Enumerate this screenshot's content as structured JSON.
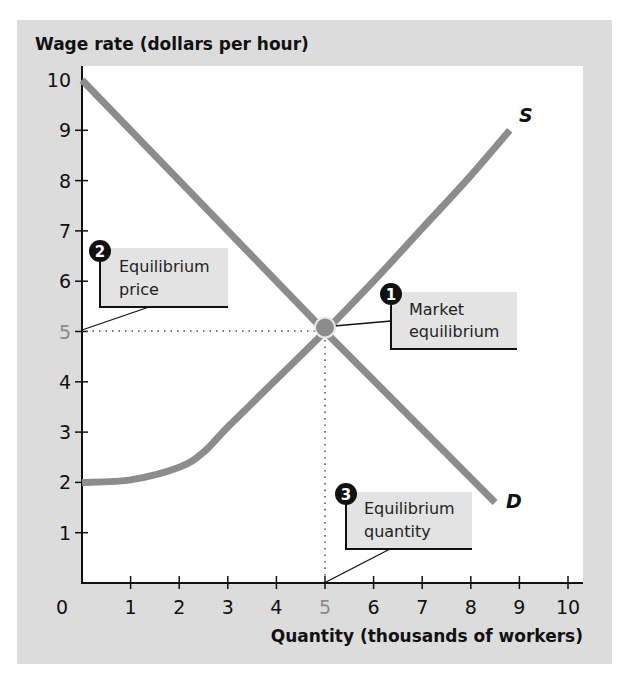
{
  "chart_data": {
    "type": "line",
    "title": "",
    "ylabel": "Wage rate (dollars per hour)",
    "xlabel": "Quantity (thousands of workers)",
    "xlim": [
      0,
      10
    ],
    "ylim": [
      0,
      10
    ],
    "grid": false,
    "x_ticks": [
      "0",
      "1",
      "2",
      "3",
      "4",
      "5",
      "6",
      "7",
      "8",
      "9",
      "10"
    ],
    "y_ticks": [
      "1",
      "2",
      "3",
      "4",
      "5",
      "6",
      "7",
      "8",
      "9",
      "10"
    ],
    "highlighted_ticks": {
      "x": "5",
      "y": "5"
    },
    "series": [
      {
        "name": "S",
        "label": "S",
        "description": "Supply curve",
        "points": [
          [
            0,
            2.0
          ],
          [
            1,
            2.05
          ],
          [
            2,
            2.3
          ],
          [
            2.5,
            2.6
          ],
          [
            3,
            3.1
          ],
          [
            4,
            4.05
          ],
          [
            5,
            5.0
          ],
          [
            6,
            6.0
          ],
          [
            7,
            7.05
          ],
          [
            8,
            8.1
          ],
          [
            8.8,
            9.0
          ]
        ]
      },
      {
        "name": "D",
        "label": "D",
        "description": "Demand curve",
        "points": [
          [
            0,
            10
          ],
          [
            5,
            5
          ],
          [
            8.5,
            1.6
          ]
        ]
      }
    ],
    "equilibrium": {
      "x": 5,
      "y": 5
    },
    "annotations": [
      {
        "number": "1",
        "text_line1": "Market",
        "text_line2": "equilibrium"
      },
      {
        "number": "2",
        "text_line1": "Equilibrium",
        "text_line2": "price"
      },
      {
        "number": "3",
        "text_line1": "Equilibrium",
        "text_line2": "quantity"
      }
    ]
  }
}
